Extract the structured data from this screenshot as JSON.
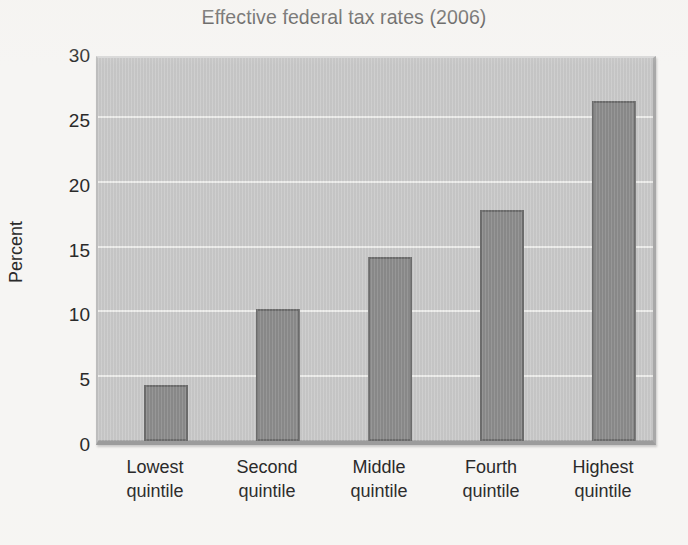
{
  "chart_data": {
    "type": "bar",
    "title": "Effective federal tax rates (2006)",
    "xlabel": "",
    "ylabel": "Percent",
    "categories": [
      "Lowest quintile",
      "Second quintile",
      "Middle quintile",
      "Fourth quintile",
      "Highest quintile"
    ],
    "category_lines": [
      [
        "Lowest",
        "quintile"
      ],
      [
        "Second",
        "quintile"
      ],
      [
        "Middle",
        "quintile"
      ],
      [
        "Fourth",
        "quintile"
      ],
      [
        "Highest",
        "quintile"
      ]
    ],
    "values": [
      4.3,
      10.2,
      14.2,
      17.8,
      26.2
    ],
    "ylim": [
      0,
      30
    ],
    "ytick_labels": [
      "0",
      "5",
      "10",
      "15",
      "20",
      "25",
      "30"
    ],
    "ytick_values": [
      0,
      5,
      10,
      15,
      20,
      25,
      30
    ],
    "grid": true,
    "legend": false,
    "colors": {
      "bar_fill": "#8b8b8b",
      "bar_border": "#6e6e6e",
      "plot_background": "#c9c9c9",
      "gridline": "#f0f0ee",
      "page_background": "#f6f5f3",
      "text": "#2a2a2a"
    }
  },
  "labels": {
    "title": "Effective federal tax rates (2006)",
    "y_axis_title": "Percent"
  }
}
